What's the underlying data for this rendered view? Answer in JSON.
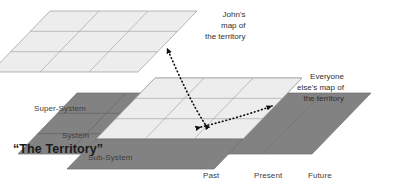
{
  "diagram": {
    "type": "layered-plane-diagram",
    "colors": {
      "background": "#ffffff",
      "light_plane_fill": "#ededed",
      "light_plane_stroke": "#9a9a9a",
      "dark_plane_fill": "#828282",
      "dark_plane_stroke": "#5a5a5a",
      "arrow": "#111111",
      "text": "#3d3d3d",
      "title_text": "#1a1a1a"
    },
    "planes": [
      {
        "id": "johns-map-plane",
        "name": "John's map of the territory",
        "shade": "light",
        "grid_rows": 3,
        "grid_cols": 3
      },
      {
        "id": "everyone-else-map-plane",
        "name": "Everyone else's map of the territory",
        "shade": "light",
        "grid_rows": 3,
        "grid_cols": 3
      },
      {
        "id": "territory-plane",
        "name": "The Territory",
        "shade": "dark",
        "grid_rows": 3,
        "grid_cols": 3
      }
    ],
    "labels": {
      "johns_map": [
        "John's",
        "map of",
        "the territory"
      ],
      "everyone_map": [
        "Everyone",
        "else's map of",
        "the territory"
      ],
      "territory": "“The Territory”",
      "super_system": "Super-System",
      "system": "System",
      "sub_system": "Sub-System",
      "past": "Past",
      "present": "Present",
      "future": "Future"
    },
    "arrows": [
      {
        "id": "arrow-territory-to-johns-map",
        "name": "dotted arrow from territory to John's map",
        "style": "dotted",
        "heads": "both"
      },
      {
        "id": "arrow-territory-to-everyone-map",
        "name": "dotted arrow from territory to everyone else's map",
        "style": "dotted",
        "heads": "both"
      }
    ]
  }
}
